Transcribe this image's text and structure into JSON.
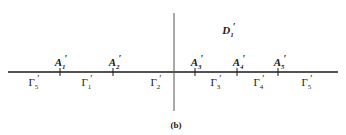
{
  "figure": {
    "caption": "(b)",
    "region_label": {
      "base": "D",
      "sub": "1",
      "prime": "′"
    },
    "axes": {
      "horizontal": {
        "x1": 8,
        "x2": 338,
        "y": 72,
        "color": "#1a1a1a"
      },
      "vertical": {
        "x": 174,
        "y1": 13,
        "y2": 111,
        "color": "#555555"
      }
    },
    "points": [
      {
        "base": "A",
        "sub": "1",
        "prime": "′",
        "x": 60
      },
      {
        "base": "A",
        "sub": "2",
        "prime": "′",
        "x": 113
      },
      {
        "base": "A",
        "sub": "3",
        "prime": "′",
        "x": 195
      },
      {
        "base": "A",
        "sub": "4",
        "prime": "′",
        "x": 237
      },
      {
        "base": "A",
        "sub": "5",
        "prime": "′",
        "x": 278
      }
    ],
    "segments": [
      {
        "base": "Γ",
        "sub": "5",
        "prime": "′",
        "x": 33
      },
      {
        "base": "Γ",
        "sub": "1",
        "prime": "′",
        "x": 86
      },
      {
        "base": "Γ",
        "sub": "2",
        "prime": "′",
        "x": 155
      },
      {
        "base": "Γ",
        "sub": "3",
        "prime": "′",
        "x": 215
      },
      {
        "base": "Γ",
        "sub": "4",
        "prime": "′",
        "x": 258
      },
      {
        "base": "Γ",
        "sub": "5",
        "prime": "′",
        "x": 306
      }
    ]
  }
}
